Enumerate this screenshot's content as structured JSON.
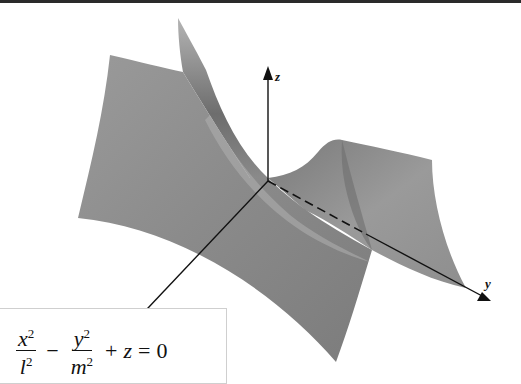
{
  "figure": {
    "surface_color": "#8c8c8c",
    "axis_color": "#111111",
    "axes": {
      "x_label": "x",
      "y_label": "y",
      "z_label": "z"
    }
  },
  "equation": {
    "term1_num_var": "x",
    "term1_num_exp": "2",
    "term1_den_var": "l",
    "term1_den_exp": "2",
    "op1": "−",
    "term2_num_var": "y",
    "term2_num_exp": "2",
    "term2_den_var": "m",
    "term2_den_exp": "2",
    "op2": "+",
    "term3": "z",
    "equals": "=",
    "rhs": "0"
  }
}
